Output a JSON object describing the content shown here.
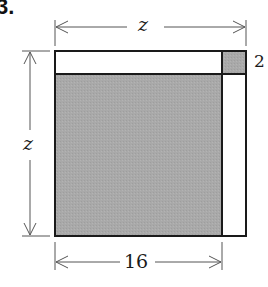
{
  "problem_number": "3.",
  "labels": {
    "top_width": "z",
    "left_height": "z",
    "small_side": "2",
    "bottom_width": "16"
  },
  "colors": {
    "shade": "#a8a8a8",
    "line": "#1a1a1a",
    "background": "#ffffff"
  }
}
